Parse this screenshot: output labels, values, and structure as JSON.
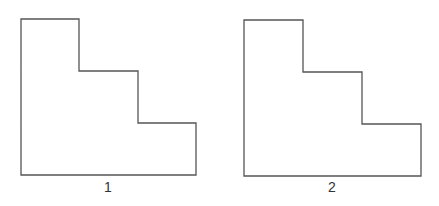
{
  "figures": [
    {
      "label": "1",
      "shape": "staircase-l",
      "points": [
        [
          21,
          19
        ],
        [
          79,
          19
        ],
        [
          79,
          71
        ],
        [
          138,
          71
        ],
        [
          138,
          123
        ],
        [
          196,
          123
        ],
        [
          196,
          175
        ],
        [
          21,
          175
        ]
      ]
    },
    {
      "label": "2",
      "shape": "staircase-l",
      "points": [
        [
          244,
          20
        ],
        [
          303,
          20
        ],
        [
          303,
          72
        ],
        [
          362,
          72
        ],
        [
          362,
          124
        ],
        [
          421,
          124
        ],
        [
          421,
          176
        ],
        [
          244,
          176
        ]
      ]
    }
  ],
  "style": {
    "stroke": "#555555",
    "fill": "#ffffff",
    "background": "#ffffff"
  }
}
